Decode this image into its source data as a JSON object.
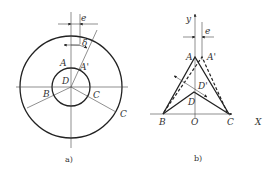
{
  "figure_a": {
    "caption": "a)",
    "labels": {
      "e": "e",
      "delta": "δ",
      "A": "A",
      "A_prime": "A'",
      "D": "D",
      "B": "B",
      "C_inner": "C",
      "C_outer": "C"
    }
  },
  "figure_b": {
    "caption": "b)",
    "labels": {
      "y": "y",
      "e": "e",
      "A": "A",
      "A_prime": "A'",
      "D_prime": "D'",
      "D": "D",
      "B": "B",
      "O": "O",
      "C": "C",
      "X": "X"
    }
  },
  "colors": {
    "line": "#222222",
    "text": "#333333",
    "background": "#ffffff"
  }
}
